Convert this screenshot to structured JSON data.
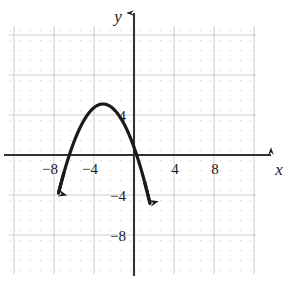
{
  "figure": {
    "kind": "cartesian-graph",
    "background_color": "#ffffff",
    "ink_color": "#1a1a1a",
    "grid_color": "#d9d9d9",
    "gridline_color": "#cfcfcf",
    "axis_label_x": "x",
    "axis_label_y": "y"
  },
  "chart_data": {
    "type": "line",
    "title": "",
    "xlabel": "x",
    "ylabel": "y",
    "grid": true,
    "legend": false,
    "xlim": [
      -12.4,
      12.1
    ],
    "ylim": [
      -12.7,
      12.7
    ],
    "xticks": [
      -8,
      -4,
      4,
      8
    ],
    "xtick_labels": [
      "−8",
      "−4",
      "4",
      "8"
    ],
    "yticks": [
      4,
      -4,
      -8
    ],
    "ytick_labels": [
      "4",
      "−4",
      "−8"
    ],
    "minor_grid_step": 1,
    "major_grid_step": 4,
    "series": [
      {
        "name": "parabola",
        "equation_form": "y = a(x - h)^2 + k",
        "a": -0.45,
        "vertex": [
          -3.1,
          5.1
        ],
        "opens": "down",
        "x_intercepts": [
          -6.45,
          0.45
        ],
        "y_intercept": 0.8,
        "x_domain": [
          -7.55,
          1.6
        ],
        "arrow_ends": [
          "down-left",
          "down-right"
        ],
        "stroke_width": 3.2,
        "color": "#1a1a1a",
        "points": [
          [
            -7.55,
            -4.9
          ],
          [
            -7.0,
            -2.1
          ],
          [
            -6.5,
            0.3
          ],
          [
            -6.0,
            1.5
          ],
          [
            -5.5,
            2.8
          ],
          [
            -5.0,
            3.7
          ],
          [
            -4.5,
            4.4
          ],
          [
            -4.0,
            4.8
          ],
          [
            -3.5,
            5.05
          ],
          [
            -3.1,
            5.1
          ],
          [
            -2.5,
            4.95
          ],
          [
            -2.0,
            4.6
          ],
          [
            -1.5,
            4.0
          ],
          [
            -1.0,
            3.2
          ],
          [
            -0.5,
            2.1
          ],
          [
            0.0,
            0.8
          ],
          [
            0.5,
            -0.7
          ],
          [
            1.0,
            -2.5
          ],
          [
            1.6,
            -5.0
          ]
        ]
      }
    ]
  },
  "axes": {
    "x_arrow": "right",
    "y_arrow": "up"
  }
}
